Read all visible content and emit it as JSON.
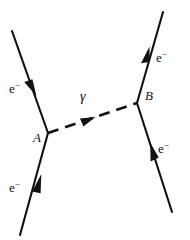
{
  "diagram": {
    "background_color": "#ffffff",
    "line_color": "#111111",
    "labels": {
      "electron_symbol": "e",
      "electron_charge_superscript": "−",
      "photon_symbol": "γ",
      "vertex_a": "A",
      "vertex_b": "B"
    },
    "legs": [
      {
        "name": "incoming-electron-upper-left",
        "label": "e",
        "superscript": "−",
        "from": [
          12,
          31
        ],
        "to": [
          48,
          133
        ],
        "arrow_at": [
          31,
          83
        ],
        "direction": "toward-vertex-a"
      },
      {
        "name": "incoming-electron-lower-left",
        "label": "e",
        "superscript": "−",
        "from": [
          20,
          235
        ],
        "to": [
          48,
          133
        ],
        "arrow_at": [
          37,
          188
        ],
        "direction": "toward-vertex-a"
      },
      {
        "name": "outgoing-electron-upper-right",
        "label": "e",
        "superscript": "−",
        "from": [
          137,
          103
        ],
        "to": [
          163,
          12
        ],
        "arrow_at": [
          146,
          58
        ],
        "direction": "away-from-vertex-b"
      },
      {
        "name": "outgoing-electron-lower-right",
        "label": "e",
        "superscript": "−",
        "from": [
          137,
          103
        ],
        "to": [
          172,
          212
        ],
        "arrow_at": [
          155,
          155
        ],
        "direction": "away-from-vertex-b"
      }
    ],
    "propagator": {
      "name": "photon-propagator",
      "label": "γ",
      "style": "dashed",
      "from": [
        48,
        133
      ],
      "to": [
        137,
        103
      ],
      "arrow_at": [
        88,
        119
      ],
      "direction": "from-a-to-b"
    },
    "vertices": [
      {
        "name": "vertex-a",
        "label": "A",
        "at": [
          48,
          133
        ]
      },
      {
        "name": "vertex-b",
        "label": "B",
        "at": [
          137,
          103
        ]
      }
    ]
  }
}
